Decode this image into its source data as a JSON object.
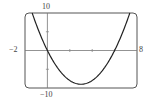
{
  "chart_data": {
    "type": "line",
    "title": "",
    "xlabel": "",
    "ylabel": "",
    "xlim": [
      -2,
      8
    ],
    "ylim": [
      -10,
      10
    ],
    "grid": false,
    "x_ticks": [
      2,
      4,
      6
    ],
    "y_ticks": [
      -5,
      5
    ],
    "tick_labels": {
      "xmin": "−2",
      "xmax": "8",
      "ymax": "10",
      "ymin": "−10"
    },
    "series": [
      {
        "name": "y = x^2 - 6x",
        "function": "x^2 - 6x",
        "x": [
          -1.36,
          -1,
          0,
          1,
          2,
          3,
          4,
          5,
          6,
          7,
          7.36
        ],
        "values": [
          10,
          7,
          0,
          -5,
          -8,
          -9,
          -8,
          -5,
          0,
          7,
          10
        ]
      }
    ],
    "colors": {
      "curve": "#222222",
      "axes": "#777777",
      "frame": "#555555"
    }
  }
}
